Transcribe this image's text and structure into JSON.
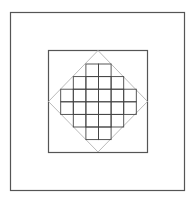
{
  "diagram": {
    "canvas": {
      "width": 195,
      "height": 204,
      "background": "#ffffff"
    },
    "outer_square": {
      "x": 10.5,
      "y": 12.5,
      "width": 174,
      "height": 178,
      "stroke": "#555555",
      "stroke_width": 1.2
    },
    "inner_square": {
      "x": 48.5,
      "y": 50.5,
      "width": 99,
      "height": 102,
      "stroke": "#555555",
      "stroke_width": 1.2
    },
    "diamond": {
      "points": "98,50.5 147.5,101.5 98,152 48.5,101.5",
      "stroke": "#bbbbbb",
      "stroke_width": 1
    },
    "grid": {
      "stroke": "#444444",
      "stroke_width": 0.9,
      "cell_size": 12.6,
      "origin_x": 60.7,
      "origin_y": 64,
      "rows": [
        {
          "row": 0,
          "cols": [
            2,
            3
          ]
        },
        {
          "row": 1,
          "cols": [
            1,
            2,
            3,
            4
          ]
        },
        {
          "row": 2,
          "cols": [
            0,
            1,
            2,
            3,
            4,
            5
          ]
        },
        {
          "row": 3,
          "cols": [
            0,
            1,
            2,
            3,
            4,
            5
          ]
        },
        {
          "row": 4,
          "cols": [
            1,
            2,
            3,
            4
          ]
        },
        {
          "row": 5,
          "cols": [
            2,
            3
          ]
        }
      ]
    }
  }
}
